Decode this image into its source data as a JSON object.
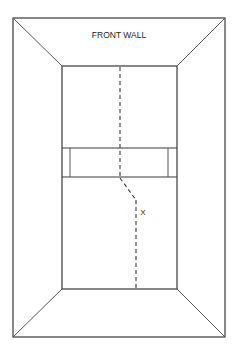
{
  "diagram": {
    "title_label": "FRONT WALL",
    "marker_label": "X",
    "colors": {
      "line": "#3a3a3a",
      "background": "#ffffff"
    },
    "geometry": {
      "outer": {
        "x1": 13,
        "y1": 18,
        "x2": 225,
        "y2": 337
      },
      "inner": {
        "x1": 62,
        "y1": 66,
        "x2": 177,
        "y2": 289
      },
      "band": {
        "y_top": 148,
        "y_bottom": 177,
        "inner_left_x": 70,
        "inner_right_x": 168
      },
      "path": {
        "upper_x": 120,
        "bend_start": [
          120,
          178
        ],
        "bend_end": [
          136,
          200
        ],
        "lower_x": 136
      }
    }
  }
}
